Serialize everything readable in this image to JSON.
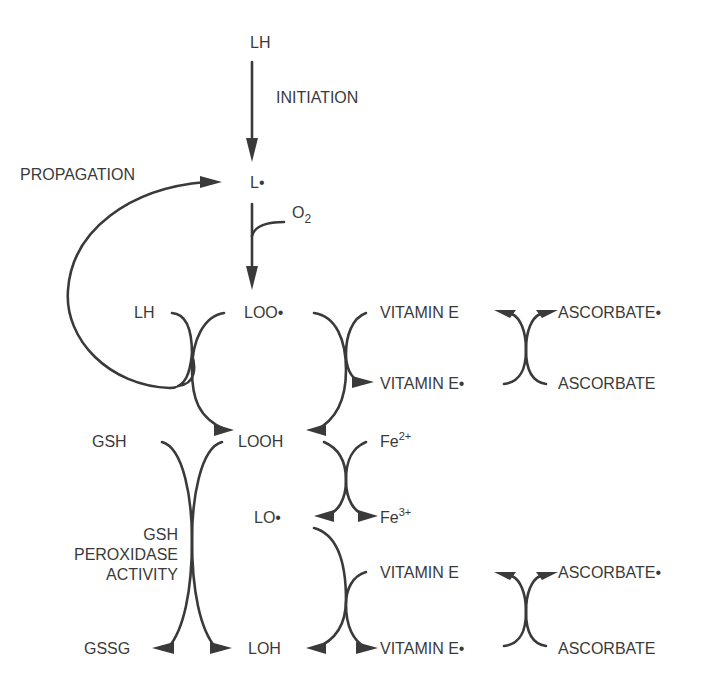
{
  "colors": {
    "ink": "#3a3a3a",
    "background": "#ffffff"
  },
  "labels": {
    "lh_top": "LH",
    "initiation": "INITIATION",
    "propagation": "PROPAGATION",
    "l_radical": "L•",
    "o2": "O",
    "o2_sub": "2",
    "lh_mid": "LH",
    "loo_radical": "LOO•",
    "vitamin_e_1": "VITAMIN E",
    "ascorbate_radical_1": "ASCORBATE•",
    "vitamin_e_radical_1": "VITAMIN E•",
    "ascorbate_1": "ASCORBATE",
    "gsh": "GSH",
    "looh": "LOOH",
    "fe": "Fe",
    "fe2_sup": "2+",
    "fe3_sup": "3+",
    "lo_radical": "LO•",
    "gsh_peroxidase_line1": "GSH",
    "gsh_peroxidase_line2": "PEROXIDASE",
    "gsh_peroxidase_line3": "ACTIVITY",
    "vitamin_e_2": "VITAMIN E",
    "ascorbate_radical_2": "ASCORBATE•",
    "gssg": "GSSG",
    "loh": "LOH",
    "vitamin_e_radical_2": "VITAMIN E•",
    "ascorbate_2": "ASCORBATE"
  },
  "arrows": [
    {
      "from": "LH",
      "to": "L•",
      "label": "INITIATION"
    },
    {
      "from": "L•",
      "to": "LOO•",
      "cofactor": "O2"
    },
    {
      "from": "LOO•",
      "to": "LOOH",
      "coupled": "LH → L• (PROPAGATION)"
    },
    {
      "from": "LOO•",
      "to": "LOOH",
      "coupled": "VITAMIN E → VITAMIN E•"
    },
    {
      "from": "VITAMIN E•",
      "to": "VITAMIN E",
      "coupled": "ASCORBATE → ASCORBATE•"
    },
    {
      "from": "LOOH",
      "to": "LO•",
      "coupled": "Fe2+ → Fe3+"
    },
    {
      "from": "LOOH",
      "to": "LOH",
      "coupled": "GSH → GSSG (GSH PEROXIDASE ACTIVITY)"
    },
    {
      "from": "LO•",
      "to": "LOH",
      "coupled": "VITAMIN E → VITAMIN E•"
    },
    {
      "from": "VITAMIN E•",
      "to": "VITAMIN E",
      "coupled": "ASCORBATE → ASCORBATE•"
    }
  ]
}
